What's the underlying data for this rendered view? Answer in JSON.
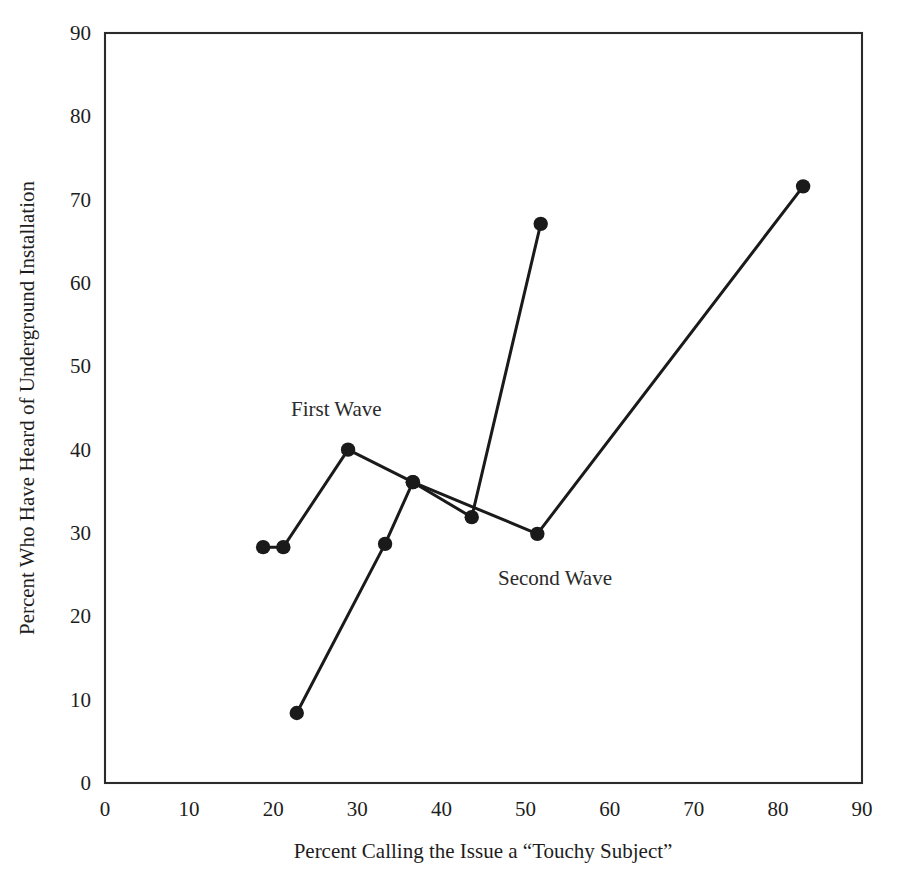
{
  "chart_data": {
    "type": "line",
    "title": "",
    "subtitle": "",
    "xlabel": "Percent Calling the Issue a “Touchy Subject”",
    "ylabel": "Percent Who Have Heard of Underground Installation",
    "xlim": [
      0,
      90
    ],
    "ylim": [
      0,
      90
    ],
    "xticks": [
      0,
      10,
      20,
      30,
      40,
      50,
      60,
      70,
      80,
      90
    ],
    "yticks": [
      0,
      10,
      20,
      30,
      40,
      50,
      60,
      70,
      80,
      90
    ],
    "xtick_labels": [
      "0",
      "10",
      "20",
      "30",
      "40",
      "50",
      "60",
      "70",
      "80",
      "90"
    ],
    "ytick_labels": [
      "0",
      "10",
      "20",
      "30",
      "40",
      "50",
      "60",
      "70",
      "80",
      "90"
    ],
    "grid": false,
    "legend_position": "inline-annotation",
    "marker": "filled-circle",
    "line_color": "#1a1a1a",
    "frame_color": "#2b2b2b",
    "background_color": "#ffffff",
    "series": [
      {
        "name": "First Wave",
        "points": [
          [
            18.8,
            28.3
          ],
          [
            21.2,
            28.3
          ],
          [
            28.9,
            40.0
          ],
          [
            36.6,
            36.1
          ],
          [
            51.4,
            29.9
          ],
          [
            83.0,
            71.6
          ]
        ]
      },
      {
        "name": "Second Wave",
        "points": [
          [
            22.8,
            8.4
          ],
          [
            33.3,
            28.7
          ],
          [
            36.6,
            36.1
          ],
          [
            43.6,
            31.9
          ],
          [
            51.8,
            67.1
          ]
        ]
      }
    ],
    "annotations": [
      {
        "text": "First Wave",
        "x": 27.5,
        "y": 44.0,
        "anchor": "middle"
      },
      {
        "text": "Second Wave",
        "x": 53.5,
        "y": 23.8,
        "anchor": "middle"
      }
    ]
  }
}
